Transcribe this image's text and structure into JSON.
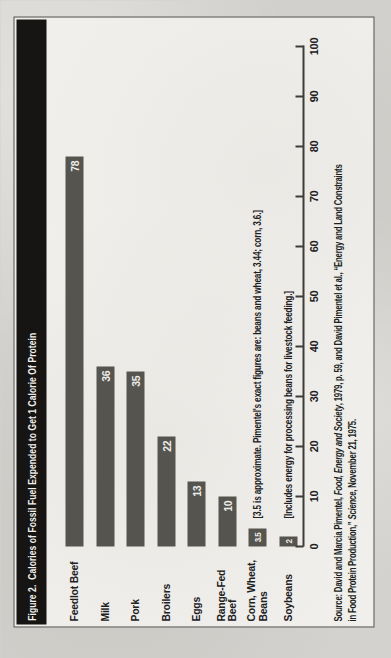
{
  "chart": {
    "title": "Figure 2.  Calories of Fossil Fuel Expended to Get 1 Calorie Of Protein"
  },
  "chart_data": {
    "type": "bar",
    "orientation": "horizontal",
    "categories": [
      "Feedlot Beef",
      "Milk",
      "Pork",
      "Broilers",
      "Eggs",
      "Range-Fed Beef",
      "Corn, Wheat, Beans",
      "Soybeans"
    ],
    "category_lines": [
      [
        "Feedlot Beef"
      ],
      [
        "Milk"
      ],
      [
        "Pork"
      ],
      [
        "Broilers"
      ],
      [
        "Eggs"
      ],
      [
        "Range-Fed",
        "Beef"
      ],
      [
        "Corn, Wheat,",
        "Beans"
      ],
      [
        "Soybeans"
      ]
    ],
    "values": [
      78,
      36,
      35,
      22,
      13,
      10,
      3.5,
      2
    ],
    "value_labels": [
      "78",
      "36",
      "35",
      "22",
      "13",
      "10",
      "3.5",
      "2"
    ],
    "xlabel": "",
    "ylabel": "",
    "xlim": [
      0,
      100
    ],
    "ticks": [
      0,
      10,
      20,
      30,
      40,
      50,
      60,
      70,
      80,
      90,
      100
    ],
    "tick_labels": [
      "0",
      "10",
      "20",
      "30",
      "40",
      "50",
      "60",
      "70",
      "80",
      "90",
      "100"
    ],
    "grid": false,
    "legend": false,
    "bar_color": "#56544e",
    "annotations": [
      {
        "index": 6,
        "row": "Corn, Wheat, Beans",
        "text": "[3.5 is approximate. Pimentel's exact figures are: beans and wheat, 3.44; corn, 3.6.]"
      },
      {
        "index": 7,
        "row": "Soybeans",
        "text": "[Includes energy for processing beans for livestock feeding.]"
      }
    ]
  },
  "source": {
    "line1_pre": "Source: David and Marcia Pimentel, ",
    "line1_italic": "Food, Energy and Society",
    "line1_post": ", 1979, p. 59, and David Pimentel et al., “Energy and Land Constraints",
    "line2_pre": "in Food Protein Production,” ",
    "line2_italic": "Science",
    "line2_post": ", November 21, 1975."
  },
  "colors": {
    "paper": "#d3d2ce",
    "chart_background": "#f0efeb",
    "title_bar": "#161514",
    "bar": "#56544e",
    "text": "#21201e",
    "value_text": "#eeede9"
  }
}
